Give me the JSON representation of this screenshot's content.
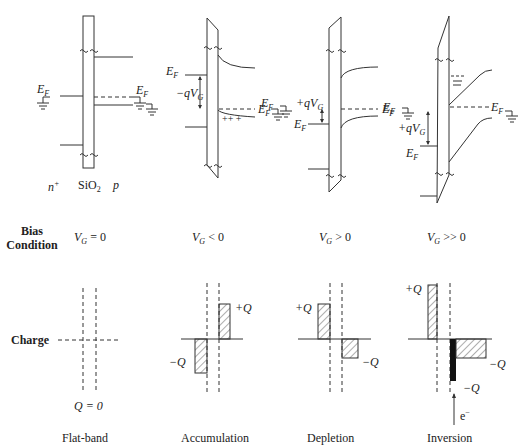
{
  "figure": {
    "row_labels": {
      "bias_line1": "Bias",
      "bias_line2": "Condition",
      "charge": "Charge"
    },
    "layer_labels": {
      "n_plus": "n",
      "n_plus_sup": "+",
      "oxide": "SiO",
      "oxide_sub": "2",
      "p": "p"
    },
    "panels": [
      {
        "name": "flat-band",
        "bias": "V_G = 0",
        "bias_var": "V",
        "bias_sub": "G",
        "bias_rel": " = 0",
        "charge_label": "Q = 0",
        "regime": "Flat-band",
        "ef_left": "E",
        "ef_sub": "F",
        "ef_right": "E",
        "ef_right_sub": "F"
      },
      {
        "name": "accumulation",
        "bias": "V_G < 0",
        "bias_var": "V",
        "bias_sub": "G",
        "bias_rel": " < 0",
        "voltage_drop": "−qV",
        "voltage_drop_sub": "G",
        "surface_charge": "++ +",
        "charge_pos": "+Q",
        "charge_neg": "−Q",
        "regime": "Accumulation",
        "ef_left": "E",
        "ef_sub": "F",
        "ef_right": "E",
        "ef_right_sub": "F"
      },
      {
        "name": "depletion",
        "bias": "V_G > 0",
        "bias_var": "V",
        "bias_sub": "G",
        "bias_rel": " > 0",
        "voltage_drop": "+qV",
        "voltage_drop_sub": "G",
        "charge_pos": "+Q",
        "charge_neg": "−Q",
        "regime": "Depletion",
        "ef_left": "E",
        "ef_sub": "F",
        "ef_right": "E",
        "ef_right_sub": "F"
      },
      {
        "name": "inversion",
        "bias": "V_G >> 0",
        "bias_var": "V",
        "bias_sub": "G",
        "bias_rel": " >> 0",
        "voltage_drop": "+qV",
        "voltage_drop_sub": "G",
        "charge_pos": "+Q",
        "charge_neg_depletion": "−Q",
        "charge_neg_inversion": "−Q",
        "electron_label": "e",
        "electron_sup": "−",
        "regime": "Inversion",
        "ef_left": "E",
        "ef_sub": "F",
        "ef_right": "E",
        "ef_right_sub": "F"
      }
    ],
    "colors": {
      "ink": "#333333",
      "background": "#ffffff",
      "inversion_fill": "#111111"
    }
  }
}
